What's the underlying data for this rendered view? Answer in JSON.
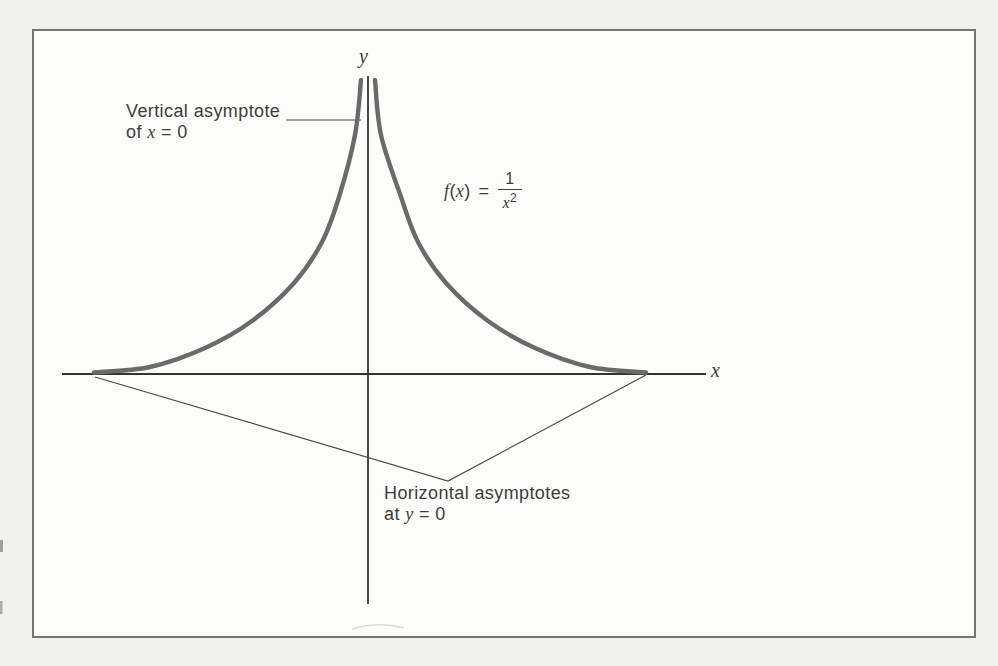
{
  "colors": {
    "page_background": "#f1f1ee",
    "canvas_background": "#fcfcfa",
    "frame_border": "#737373",
    "axis": "#333333",
    "curve": "#6a6a6a",
    "leader_line": "#4a4a4a",
    "text": "#3d3d3d"
  },
  "labels": {
    "axis": {
      "x": "x",
      "y": "y"
    },
    "vertical": {
      "line1": "Vertical asymptote",
      "line2_pre": "of ",
      "line2_var": "x",
      "line2_post": " = 0"
    },
    "horizontal": {
      "line1": "Horizontal asymptotes",
      "line2_pre": "at ",
      "line2_var": "y",
      "line2_post": " = 0"
    },
    "formula": {
      "func": "f",
      "open_paren": "(",
      "arg": "x",
      "close_paren": ")",
      "equals": "=",
      "numerator": "1",
      "denom_base": "x",
      "denom_exp": "2"
    }
  },
  "chart_data": {
    "type": "line",
    "title": "",
    "function": "f(x) = 1/x^2",
    "xlabel": "x",
    "ylabel": "y",
    "axis_ticks": "none (unscaled sketch)",
    "grid": false,
    "vertical_asymptote": "x = 0",
    "horizontal_asymptote": "y = 0",
    "annotations": [
      "Vertical asymptote of x = 0",
      "Horizontal asymptotes at y = 0",
      "f(x) = 1/x²"
    ],
    "series": [
      {
        "name": "f(x) = 1/x^2, x < 0",
        "x": [
          -4.5,
          -3.5,
          -2.5,
          -1.8,
          -1.2,
          -0.8,
          -0.5,
          -0.35,
          -0.25
        ],
        "y": [
          0.049,
          0.082,
          0.16,
          0.309,
          0.694,
          1.563,
          4.0,
          8.163,
          16.0
        ]
      },
      {
        "name": "f(x) = 1/x^2, x > 0",
        "x": [
          0.25,
          0.35,
          0.5,
          0.8,
          1.2,
          1.8,
          2.5,
          3.5,
          4.5
        ],
        "y": [
          16.0,
          8.163,
          4.0,
          1.563,
          0.694,
          0.309,
          0.16,
          0.082,
          0.049
        ]
      }
    ]
  },
  "geometry": {
    "svg": {
      "width": 998,
      "height": 666
    },
    "x_axis": {
      "x1": 62,
      "y1": 374,
      "x2": 706,
      "y2": 374,
      "width": 1.8
    },
    "y_axis": {
      "x1": 368,
      "y1": 76,
      "x2": 368,
      "y2": 604,
      "width": 1.8
    },
    "curve_width": 4.4,
    "left_branch": [
      [
        94,
        372.5
      ],
      [
        150,
        367
      ],
      [
        205,
        348
      ],
      [
        252,
        321
      ],
      [
        294,
        283
      ],
      [
        322,
        242
      ],
      [
        339,
        197
      ],
      [
        355,
        135
      ],
      [
        361,
        80
      ]
    ],
    "right_branch": [
      [
        646,
        372.5
      ],
      [
        590,
        367
      ],
      [
        535,
        348
      ],
      [
        488,
        321
      ],
      [
        446,
        283
      ],
      [
        418,
        242
      ],
      [
        401,
        197
      ],
      [
        381,
        135
      ],
      [
        375,
        80
      ]
    ],
    "vertical_leader": [
      [
        286,
        120
      ],
      [
        361,
        120
      ]
    ],
    "horizontal_leader": [
      [
        95,
        377
      ],
      [
        448,
        481
      ],
      [
        646,
        375
      ]
    ],
    "leader_width": 1.2,
    "bottom_artifact": "M 352 629 Q 378 621 404 628",
    "edge_artifacts": [
      {
        "x": 0,
        "y": 540,
        "w": 3,
        "h": 12,
        "opacity": 0.55
      },
      {
        "x": 0,
        "y": 601,
        "w": 2.5,
        "h": 13,
        "opacity": 0.45
      }
    ]
  }
}
